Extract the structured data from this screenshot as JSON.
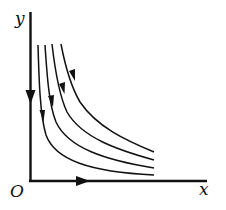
{
  "diagram": {
    "type": "phase-portrait",
    "axes": {
      "x_label": "x",
      "y_label": "y",
      "origin_label": "O",
      "y_axis_arrow": "down",
      "x_axis_arrow": "right"
    },
    "curves": [
      {
        "id": 1,
        "direction": "downward-then-right"
      },
      {
        "id": 2,
        "direction": "downward-then-right"
      },
      {
        "id": 3,
        "direction": "downward-then-right"
      },
      {
        "id": 4,
        "direction": "downward-then-right"
      }
    ],
    "color": "#111111"
  }
}
